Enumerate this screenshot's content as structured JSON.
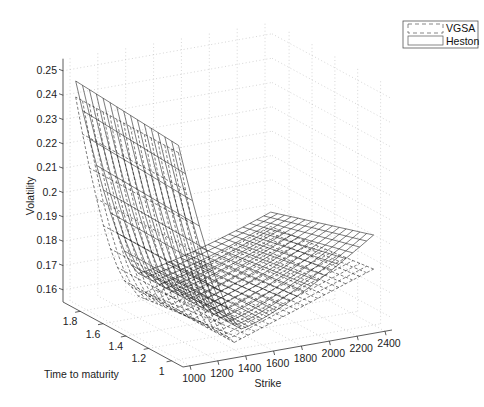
{
  "chart_data": {
    "type": "surface3d",
    "title": "",
    "xlabel": "Strike",
    "ylabel": "Time to maturity",
    "zlabel": "Volatility",
    "x_ticks": [
      1000,
      1200,
      1400,
      1600,
      1800,
      2000,
      2200,
      2400
    ],
    "y_ticks": [
      1,
      1.2,
      1.4,
      1.6,
      1.8
    ],
    "z_ticks": [
      0.16,
      0.17,
      0.18,
      0.19,
      0.2,
      0.21,
      0.22,
      0.23,
      0.24,
      0.25
    ],
    "xlim": [
      950,
      2450
    ],
    "ylim": [
      0.9,
      1.95
    ],
    "zlim": [
      0.155,
      0.255
    ],
    "grid": true,
    "legend": {
      "position": "top-right",
      "entries": [
        {
          "label": "VGSA",
          "style": "dashed"
        },
        {
          "label": "Heston",
          "style": "solid"
        }
      ]
    },
    "series": [
      {
        "name": "VGSA",
        "style": "dashed",
        "description": "Implied volatility surface; ~0.24 at strike 1000 long maturity, minimum ~0.16 near strike 1400, rising to ~0.178 at strike 2400",
        "corner_values": {
          "k1000_t1.9": 0.24,
          "k1000_t1.0": 0.24,
          "k1400_t1.0": 0.158,
          "k2400_t1.0": 0.178,
          "k2400_t1.9": 0.17
        }
      },
      {
        "name": "Heston",
        "style": "solid",
        "description": "Implied volatility surface; ~0.247 at strike 1000 long maturity, minimum ~0.165 near strike 1500, rising to ~0.19 at strike 2400",
        "corner_values": {
          "k1000_t1.9": 0.247,
          "k1000_t1.0": 0.24,
          "k1400_t1.0": 0.162,
          "k2400_t1.0": 0.192,
          "k2400_t1.9": 0.176
        }
      }
    ]
  },
  "labels": {
    "zlabel": "Volatility",
    "ylabel": "Time to maturity",
    "xlabel": "Strike",
    "legend_vgsa": "VGSA",
    "legend_heston": "Heston"
  }
}
